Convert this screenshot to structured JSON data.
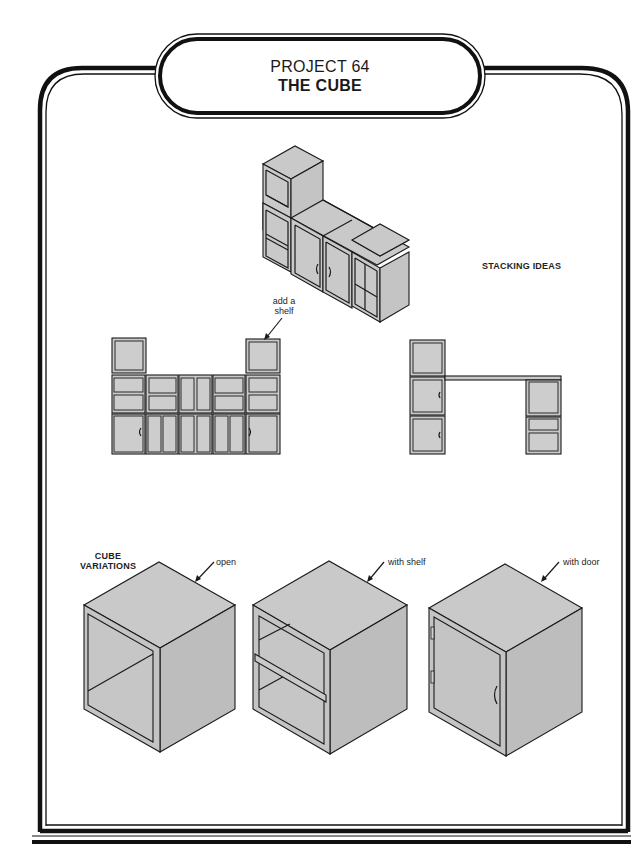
{
  "header": {
    "project_number": "PROJECT 64",
    "project_title": "THE CUBE"
  },
  "sections": {
    "stacking": {
      "heading": "STACKING IDEAS",
      "annotation": "add a\nshelf",
      "annotation_line1": "add a",
      "annotation_line2": "shelf",
      "illustrations": [
        "stacked-cubes-isometric",
        "wall-unit-front-view",
        "desk-front-view"
      ]
    },
    "variations": {
      "heading_line1": "CUBE",
      "heading_line2": "VARIATIONS",
      "items": [
        {
          "label": "open"
        },
        {
          "label": "with shelf"
        },
        {
          "label": "with door"
        }
      ]
    }
  },
  "colors": {
    "fill_gray": "#c8c8c8",
    "line": "#1a1a1a",
    "background": "#ffffff"
  }
}
